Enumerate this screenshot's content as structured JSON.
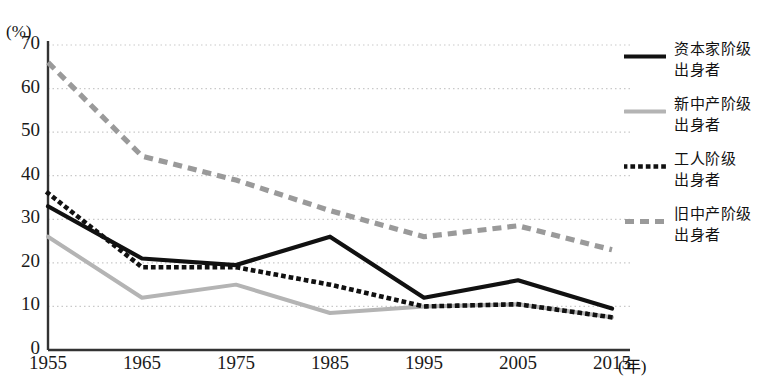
{
  "chart": {
    "title": "",
    "y_unit_label": "(%)",
    "x_unit_label": "(年)",
    "y_ticks": [
      "0",
      "10",
      "20",
      "30",
      "40",
      "50",
      "60",
      "70"
    ],
    "x_ticks": [
      "1955",
      "1965",
      "1975",
      "1985",
      "1995",
      "2005",
      "2015"
    ]
  },
  "legend": {
    "items": [
      {
        "label_line1": "资本家阶级",
        "label_line2": "出身者",
        "style": "solid-black",
        "color": "#111111"
      },
      {
        "label_line1": "新中产阶级",
        "label_line2": "出身者",
        "style": "solid-gray",
        "color": "#b4b4b4"
      },
      {
        "label_line1": "工人阶级",
        "label_line2": "出身者",
        "style": "dotted-black",
        "color": "#111111"
      },
      {
        "label_line1": "旧中产阶级",
        "label_line2": "出身者",
        "style": "dashed-gray",
        "color": "#9a9a9a"
      }
    ]
  },
  "chart_data": {
    "type": "line",
    "title": "",
    "xlabel": "(年)",
    "ylabel": "(%)",
    "x": [
      "1955",
      "1965",
      "1975",
      "1985",
      "1995",
      "2005",
      "2015"
    ],
    "ylim": [
      0,
      70
    ],
    "xlim": [
      "1955",
      "2015"
    ],
    "grid": "horizontal-dotted",
    "legend_position": "right",
    "series": [
      {
        "name": "资本家阶级出身者",
        "style": "solid-black",
        "color": "#111111",
        "values": [
          33,
          21,
          19.5,
          26,
          12,
          16,
          9.5
        ]
      },
      {
        "name": "新中产阶级出身者",
        "style": "solid-gray",
        "color": "#b4b4b4",
        "values": [
          26,
          12,
          15,
          8.5,
          10,
          10.5,
          7.5
        ]
      },
      {
        "name": "工人阶级出身者",
        "style": "dotted-black",
        "color": "#111111",
        "values": [
          36,
          19,
          19,
          15,
          10,
          10.5,
          7.5
        ]
      },
      {
        "name": "旧中产阶级出身者",
        "style": "dashed-gray",
        "color": "#9a9a9a",
        "values": [
          66,
          44.5,
          39,
          32,
          26,
          28.5,
          23
        ]
      }
    ]
  }
}
